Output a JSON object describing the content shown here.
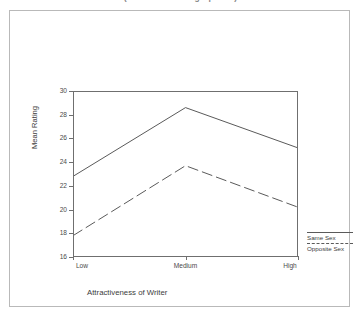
{
  "caption": "(Mean from 1-30 graphical)",
  "axis_titles": {
    "x": "Attractiveness of Writer",
    "y": "Mean Rating"
  },
  "legend": {
    "items": [
      {
        "label": "Same Sex",
        "style": "solid"
      },
      {
        "label": "Opposite Sex",
        "style": "dashed"
      }
    ]
  },
  "chart_data": {
    "type": "line",
    "title": "",
    "xlabel": "Attractiveness of Writer",
    "ylabel": "Mean Rating",
    "categories": [
      "Low",
      "Medium",
      "High"
    ],
    "series": [
      {
        "name": "Same Sex",
        "style": "solid",
        "values": [
          22.8,
          28.6,
          25.2
        ]
      },
      {
        "name": "Opposite Sex",
        "style": "dashed",
        "values": [
          17.8,
          23.7,
          20.2
        ]
      }
    ],
    "ylim": [
      16,
      30
    ],
    "yticks": [
      16,
      18,
      20,
      22,
      24,
      26,
      28,
      30
    ],
    "ytick_labels": [
      "16",
      "18",
      "20",
      "22",
      "24",
      "26",
      "28",
      "30"
    ],
    "grid": false,
    "legend_position": "right-bottom"
  }
}
